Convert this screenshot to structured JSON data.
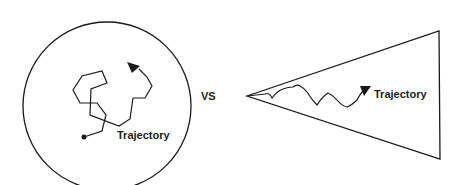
{
  "diagram": {
    "left_panel": {
      "shape": "circle",
      "label": "Trajectory",
      "description": "confined random walk with start dot and end arrow"
    },
    "separator": {
      "label": "VS"
    },
    "right_panel": {
      "shape": "cone",
      "label": "Trajectory",
      "description": "directed wavy path expanding from apex toward the right"
    },
    "colors": {
      "stroke": "#1a1a1a",
      "background": "#ffffff"
    }
  }
}
